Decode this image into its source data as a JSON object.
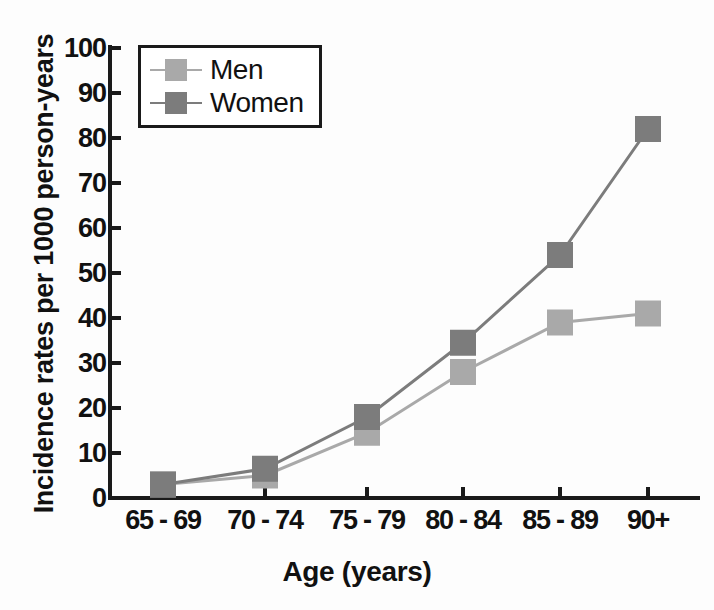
{
  "chart_data": {
    "type": "line",
    "title": "",
    "xlabel": "Age (years)",
    "ylabel": "Incidence rates per 1000 person-years",
    "categories": [
      "65 - 69",
      "70 - 74",
      "75 - 79",
      "80 - 84",
      "85 - 89",
      "90+"
    ],
    "series": [
      {
        "name": "Men",
        "values": [
          3,
          5,
          14.5,
          28,
          39,
          41
        ],
        "color": "#a9a9a9"
      },
      {
        "name": "Women",
        "values": [
          3,
          6.5,
          18,
          34.5,
          54,
          82
        ],
        "color": "#7c7c7c"
      }
    ],
    "ylim": [
      0,
      100
    ],
    "yticks": [
      0,
      10,
      20,
      30,
      40,
      50,
      60,
      70,
      80,
      90,
      100
    ],
    "grid": false,
    "legend_position": "top-left",
    "marker": "square",
    "axis_color": "#1a1a1a"
  },
  "legend": {
    "items": [
      {
        "label": "Men"
      },
      {
        "label": "Women"
      }
    ]
  }
}
